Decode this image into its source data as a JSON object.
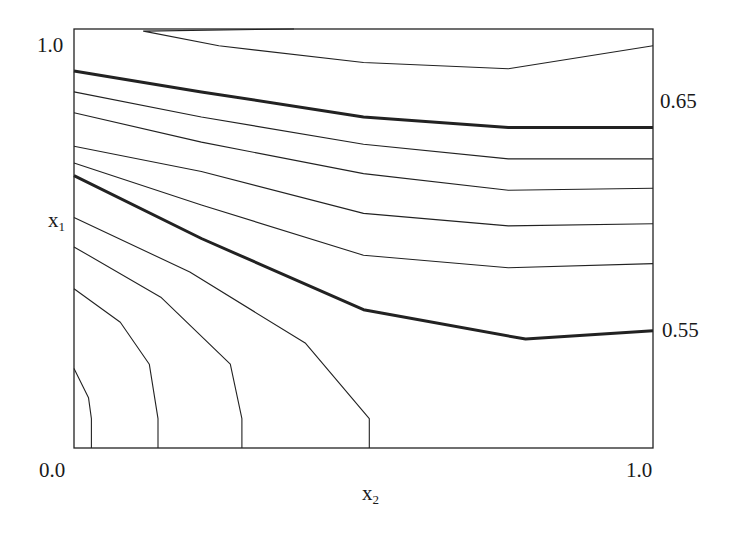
{
  "chart_data": {
    "type": "contour",
    "title": "",
    "xlabel": "x2",
    "ylabel": "x1",
    "xlim": [
      0.0,
      1.0
    ],
    "ylim": [
      0.0,
      1.0
    ],
    "x_tick_labels": [
      "0.0",
      "1.0"
    ],
    "y_tick_labels": [
      "1.0"
    ],
    "grid": false,
    "contour_labels": [
      {
        "text": "0.65",
        "position": "right edge, upper",
        "bold_line": true
      },
      {
        "text": "0.55",
        "position": "right edge, middle",
        "bold_line": true
      }
    ],
    "levels_note": "Thin contours at intermediate levels; bold contours labeled 0.65 and 0.55",
    "contours": [
      {
        "id": "c1",
        "bold": false,
        "points": [
          [
            0.38,
            1.0
          ],
          [
            0.12,
            0.995
          ],
          [
            0.25,
            0.96
          ],
          [
            0.5,
            0.92
          ],
          [
            0.75,
            0.905
          ],
          [
            1.0,
            0.96
          ]
        ]
      },
      {
        "id": "c2",
        "bold": true,
        "level": 0.65,
        "points": [
          [
            0.0,
            0.9
          ],
          [
            0.22,
            0.85
          ],
          [
            0.5,
            0.79
          ],
          [
            0.75,
            0.765
          ],
          [
            1.0,
            0.765
          ]
        ]
      },
      {
        "id": "c3",
        "bold": false,
        "points": [
          [
            0.0,
            0.85
          ],
          [
            0.22,
            0.79
          ],
          [
            0.5,
            0.725
          ],
          [
            0.75,
            0.69
          ],
          [
            1.0,
            0.69
          ]
        ]
      },
      {
        "id": "c4",
        "bold": false,
        "points": [
          [
            0.0,
            0.8
          ],
          [
            0.22,
            0.73
          ],
          [
            0.5,
            0.655
          ],
          [
            0.75,
            0.615
          ],
          [
            1.0,
            0.62
          ]
        ]
      },
      {
        "id": "c5",
        "bold": false,
        "points": [
          [
            0.0,
            0.72
          ],
          [
            0.22,
            0.66
          ],
          [
            0.5,
            0.56
          ],
          [
            0.75,
            0.53
          ],
          [
            1.0,
            0.535
          ]
        ]
      },
      {
        "id": "c6",
        "bold": false,
        "points": [
          [
            0.0,
            0.68
          ],
          [
            0.22,
            0.58
          ],
          [
            0.5,
            0.46
          ],
          [
            0.75,
            0.43
          ],
          [
            1.0,
            0.44
          ]
        ]
      },
      {
        "id": "c7",
        "bold": true,
        "level": 0.55,
        "points": [
          [
            0.0,
            0.65
          ],
          [
            0.22,
            0.5
          ],
          [
            0.5,
            0.33
          ],
          [
            0.78,
            0.26
          ],
          [
            1.0,
            0.28
          ]
        ]
      },
      {
        "id": "c8",
        "bold": false,
        "points": [
          [
            0.0,
            0.55
          ],
          [
            0.2,
            0.42
          ],
          [
            0.4,
            0.25
          ],
          [
            0.51,
            0.07
          ],
          [
            0.51,
            0.0
          ]
        ]
      },
      {
        "id": "c9",
        "bold": false,
        "points": [
          [
            0.0,
            0.48
          ],
          [
            0.15,
            0.36
          ],
          [
            0.27,
            0.2
          ],
          [
            0.29,
            0.07
          ],
          [
            0.29,
            0.0
          ]
        ]
      },
      {
        "id": "c10",
        "bold": false,
        "points": [
          [
            0.0,
            0.38
          ],
          [
            0.08,
            0.3
          ],
          [
            0.13,
            0.2
          ],
          [
            0.145,
            0.07
          ],
          [
            0.145,
            0.0
          ]
        ]
      },
      {
        "id": "c11",
        "bold": false,
        "points": [
          [
            0.0,
            0.19
          ],
          [
            0.025,
            0.12
          ],
          [
            0.03,
            0.07
          ],
          [
            0.03,
            0.0
          ]
        ]
      }
    ]
  },
  "labels": {
    "y_top": "1.0",
    "origin": "0.0",
    "x_right": "1.0",
    "x_axis_var": "x",
    "x_axis_sub": "2",
    "y_axis_var": "x",
    "y_axis_sub": "1",
    "level_upper": "0.65",
    "level_lower": "0.55"
  }
}
